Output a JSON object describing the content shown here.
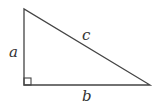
{
  "diagram": {
    "type": "right-triangle",
    "labels": {
      "vertical_leg": "a",
      "horizontal_leg": "b",
      "hypotenuse": "c"
    },
    "right_angle_marker": true,
    "stroke_color": "#444444",
    "background": "#ffffff"
  }
}
